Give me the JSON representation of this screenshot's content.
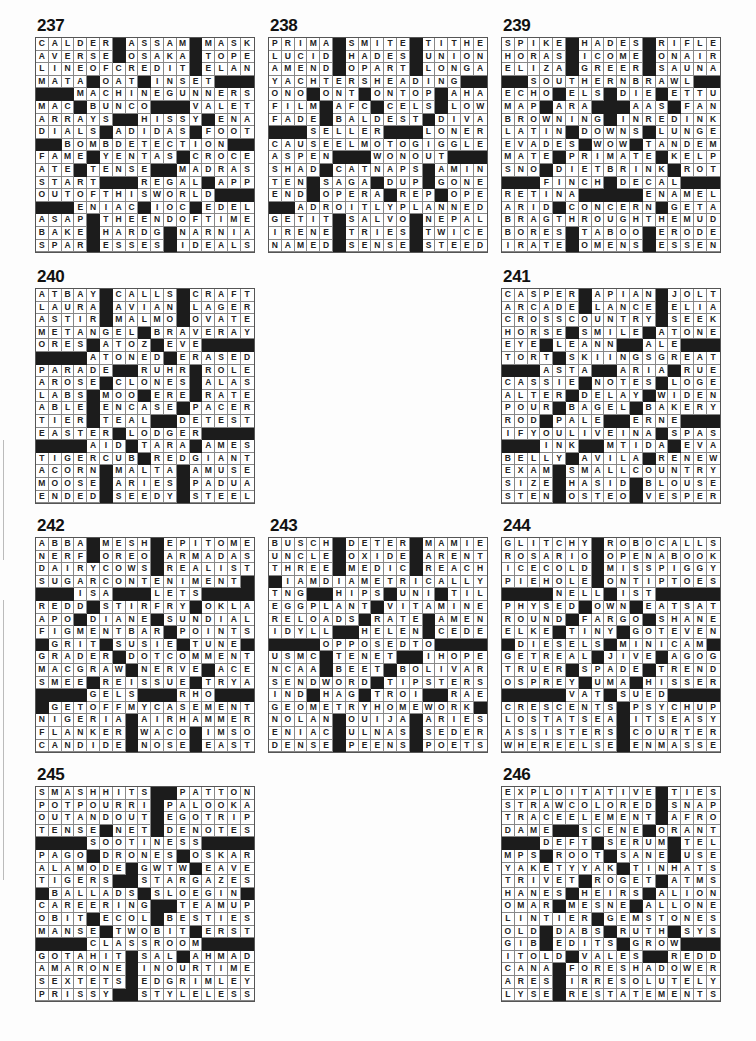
{
  "page": {
    "black_color": "#1c1c1c",
    "puzzles": [
      {
        "number": "237",
        "x": 35,
        "y": 17,
        "rows": [
          "CALDER#ASSAM#MASK",
          "AVERSE#OSAKA#TOPE",
          "LINEOFCREDIT#ELAN",
          "MATA#OAT#INSET###",
          "###MACHINEGUNNERS",
          "MAC#BUNCO###VALET",
          "ARRAYS##HISSY#ENA",
          "DIALS#ADIDAS#FOOT",
          "##BOMBDETECTION##",
          "FAME#YENTAS#CROCE",
          "ATE#TENSE##MADRAS",
          "START###REGAL#APP",
          "OUTOFTHISWORLD###",
          "###ENIAC#IOC#EDEL",
          "ASAP#THEENDOFTIME",
          "BAKE#HARDG#NARNIA",
          "SPAR#ESSES#IDEALS"
        ]
      },
      {
        "number": "238",
        "x": 268,
        "y": 17,
        "rows": [
          "PRIMA#SMITE#TITHE",
          "LUCID#HADES#UNION",
          "AMEND#OPART#LONGA",
          "YACHTERSHEADING##",
          "ONO#ONT#ONTOP#AHA",
          "FILM#AFC#CELS#LOW",
          "FADE#BALDEST#DIVA",
          "###SELLER###LONER",
          "CAUSEELMOTOGIGGLE",
          "ASPEN###WONOUT###",
          "SHAD#CATNAPS#AMIN",
          "TEN#SAGA#DUP#GONE",
          "END#OPERA#REP#OPE",
          "##ADROITLYPLANNED",
          "GETIT#SALVO#NEPAL",
          "IRENE#TRIES#TWICE",
          "NAMED#SENSE#STEED"
        ]
      },
      {
        "number": "239",
        "x": 501,
        "y": 17,
        "rows": [
          "SPIKE#HADES#RIFLE",
          "HORAS#ICOME#ONAIR",
          "ELIZA#GREER#SAUNA",
          "##SOUTHERNBRAWL##",
          "ECHO#ELS#DIE#ETTU",
          "MAP#ARA###AAS#FAN",
          "BROWNING#INREDINK",
          "LATIN#DOWNS#LUNGE",
          "EVADES#WOW#TANDEM",
          "MATE#PRIMATE#KELP",
          "SNO#DIETBRINK#ROT",
          "###FINCH#DECAL###",
          "RETINA#####ENAMEL",
          "ARID#CONCERN#GETA",
          "BRAGTHROUGHTHEMUD",
          "BORES#TABOO#ERODE",
          "IRATE#OMENS#ESSEN"
        ]
      },
      {
        "number": "240",
        "x": 35,
        "y": 268,
        "rows": [
          "ATBAY#CALLS#CRAFT",
          "LAURA#AVIAN#LAGER",
          "ASTIR#MALMO#OVATE",
          "METANGEL#BRAVERAY",
          "ORES#ATOZ#EVE####",
          "####ATONED#ERASED",
          "PARADE##RUHR#ROLE",
          "AROSE#CLONES#ALAS",
          "LABS#MOO#ERE#RATE",
          "ABLE#ENCASE#PACER",
          "TIER#TEAL##DETEST",
          "EASTER#LODGER####",
          "####AID#TARA#AMES",
          "TIGERCUB#REDGIANT",
          "ACORN#MALTA#AMUSE",
          "MOOSE#ARIES#PADUA",
          "ENDED#SEEDY#STEEL"
        ]
      },
      {
        "number": "241",
        "x": 501,
        "y": 268,
        "rows": [
          "CASPER#APIAN#JOLT",
          "ARCADE#LANCE#ELIA",
          "CROSSCOUNTRY#SEEK",
          "HORSE#SMILE#ATONE",
          "EYE#LEANN##ALE###",
          "TORT#SKIINGSGREAT",
          "###ASTA##ARIA#RUE",
          "CASSIE#NOTES#LOGE",
          "ALTER#DELAY#WIDEN",
          "POUR#BAGEL#BAKERY",
          "ROD#PALE##ERNE###",
          "IFYOULIVEINA#SPAS",
          "###INK##MTIDA#EVA",
          "BELLY#AVILA#RENEW",
          "EXAM#SMALLCOUNTRY",
          "SIZE#HASID#BLOUSE",
          "STEN#OSTEO#VESPER"
        ]
      },
      {
        "number": "242",
        "x": 35,
        "y": 517,
        "rows": [
          "ABBA#MESH#EPITOME",
          "NERF#OREO#ARMADAS",
          "DAIRYCOWS#REALIST",
          "SUGARCONTENIMENT#",
          "###ISA###LETS####",
          "REDD#STIRFRY#OKLA",
          "APO#DIANE#SUNDIAL",
          "FIGMENTBAR#POINTS",
          "#GRIT#SUSIE#TUNE#",
          "GRADER#DOTCOMMENT",
          "MACGRAW#NERVE#ACE",
          "SMEE#REISSUE#TRYA",
          "####GELS###RHO###",
          "#GETOFFMYCASEMENT",
          "NIGERIA#AIRHAMMER",
          "FLANKER#WACO#IMSO",
          "CANDIDE#NOSE#EAST"
        ]
      },
      {
        "number": "243",
        "x": 268,
        "y": 517,
        "rows": [
          "BUSCH#DETER#MAMIE",
          "UNCLE#OXIDE#ARENT",
          "THREE#MEDIC#REACH",
          "#IAMDIAMETRICALLY",
          "TNG##HIPS#UNI#TIL",
          "EGGPLANT#VITAMINE",
          "RELOADS#RATE#AMEN",
          "IDYLL##HELEN#CEDE",
          "####OPPOSEDTO####",
          "USMC#TENET##IHOPE",
          "NCAA#BEET#BOLIVAR",
          "SENDWORD#TIPSTERS",
          "IND#HAG#TROI##RAE",
          "GEOMETRYHOMEWORK#",
          "NOLAN#OUIJA#ARIES",
          "ENIAC#ULNAS#SEDER",
          "DENSE#PEENS#POETS"
        ]
      },
      {
        "number": "244",
        "x": 501,
        "y": 517,
        "rows": [
          "GLITCHY#ROBOCALLS",
          "ROSARIO#OPENABOOK",
          "ICECOLD#MISSPIGGY",
          "PIEHOLE#ONTIPTOES",
          "####NELL#IST#####",
          "PHYSED#OWN#EATSAT",
          "ROUND#FARGO#SHANE",
          "ELKE#TINY#GOTEVEN",
          "#DIESELS#MINICAM#",
          "GETREAL#JIVE#AGOG",
          "TRUER#SPADE#TREND",
          "OSPREY#UMA#HISSER",
          "#####VAT#SUED####",
          "CRESCENTS#PSYCHUP",
          "LOSTATSEA#ITSEASY",
          "ASSISTERS#COURTER",
          "WHEREELSE#ENMASSE"
        ]
      },
      {
        "number": "245",
        "x": 35,
        "y": 766,
        "rows": [
          "SMASHHITS##PATTON",
          "POTPOURRI#PALOOKA",
          "OUTANDOUT#EGOTRIP",
          "TENSE#NET#DENOTES",
          "####SOOTINESS####",
          "PAGO#DRONES#OSKAR",
          "ALAMODE#GWTW#EAVE",
          "TIGERS##STARGAZES",
          "#BALLADS#SLOEGIN#",
          "CAREERING##TEAMUP",
          "OBIT#ECOL#BESTIES",
          "MANSE#TWOBIT#ERST",
          "####CLASSROOM####",
          "GOTAHIT#SAL#AHMAD",
          "AMARONE#INOURTIME",
          "SEXTETS#EDGRIMLEY",
          "PRISSY##STYLELESS"
        ]
      },
      {
        "number": "246",
        "x": 501,
        "y": 766,
        "rows": [
          "EXPLOITATIVE#TIES",
          "STRAWCOLORED#SNAP",
          "TRACEELEMENT#AFRO",
          "DAME##SCENE#ORANT",
          "###DEFT#SERUM#TEL",
          "MPS#ROOT#SANE#USE",
          "YAKETYYAK#TINHATS",
          "TRIVET#ROGET#ATMS",
          "HANES#HEIRS#ALION",
          "OMAR#MESNE#ALLONE",
          "LINTIER#GEMSTONES",
          "OLD#DABS#RUTH#SYS",
          "GIB#EDITS#GROW###",
          "ITOLD#VALES##REDD",
          "CANA#FORESHADOWER",
          "ARES#IRRESOLUTELY",
          "LYSE#RESTATEMENTS"
        ]
      }
    ]
  }
}
